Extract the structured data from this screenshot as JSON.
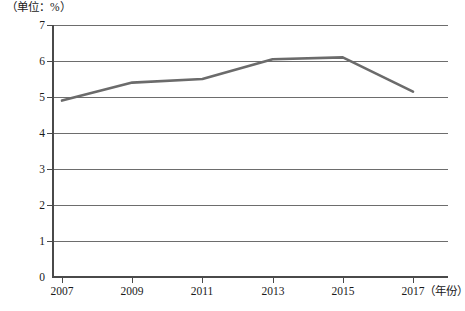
{
  "figure": {
    "y_unit_label": "（单位：%）",
    "x_unit_label": "（年份）",
    "caption": ""
  },
  "chart_data": {
    "type": "line",
    "title": "",
    "subtitle": "",
    "xlabel": "（年份）",
    "ylabel": "（单位：%）",
    "x": [
      2007,
      2009,
      2011,
      2013,
      2015,
      2017
    ],
    "categories": [
      "2007",
      "2009",
      "2011",
      "2013",
      "2015",
      "2017"
    ],
    "values": [
      4.9,
      5.4,
      5.5,
      6.05,
      6.1,
      5.15
    ],
    "series": [
      {
        "name": "",
        "values": [
          4.9,
          5.4,
          5.5,
          6.05,
          6.1,
          5.15
        ]
      }
    ],
    "xlim": [
      2007,
      2017
    ],
    "ylim": [
      0,
      7
    ],
    "ytick_labels": [
      "7",
      "6",
      "5",
      "4",
      "3",
      "2",
      "1",
      "0"
    ],
    "ytick_values": [
      7,
      6,
      5,
      4,
      3,
      2,
      1,
      0
    ],
    "xtick_labels": [
      "2007",
      "2009",
      "2011",
      "2013",
      "2015",
      "2017"
    ],
    "grid": true,
    "legend": "none",
    "line_color": "#6b6b6b",
    "grid_color": "#6d6d6d",
    "axis_color": "#4a4a4a"
  }
}
